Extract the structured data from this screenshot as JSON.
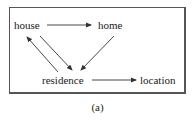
{
  "diagram": {
    "nodes": [
      {
        "id": "house",
        "label": "house"
      },
      {
        "id": "home",
        "label": "home"
      },
      {
        "id": "residence",
        "label": "residence"
      },
      {
        "id": "location",
        "label": "location"
      }
    ],
    "edges": [
      {
        "from": "house",
        "to": "home"
      },
      {
        "from": "house",
        "to": "residence"
      },
      {
        "from": "residence",
        "to": "house"
      },
      {
        "from": "home",
        "to": "residence"
      },
      {
        "from": "residence",
        "to": "location"
      }
    ],
    "caption": "(a)",
    "colors": {
      "line": "#333333",
      "frame": "#555555",
      "text": "#1a1a1a"
    }
  }
}
